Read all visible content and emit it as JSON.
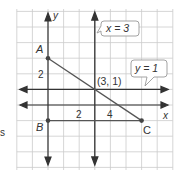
{
  "diagram": {
    "type": "coordinate-plane",
    "axes": {
      "x_label": "x",
      "y_label": "y",
      "x_tick_labels": [
        "2",
        "4"
      ],
      "y_tick_labels": [
        "2"
      ]
    },
    "points": [
      {
        "name": "A",
        "x": 0,
        "y": 3
      },
      {
        "name": "B",
        "x": 0,
        "y": -1
      },
      {
        "name": "C",
        "x": 6,
        "y": -1
      }
    ],
    "intersection": {
      "label": "(3, 1)",
      "x": 3,
      "y": 1
    },
    "lines": [
      {
        "equation": "x = 3",
        "orientation": "vertical"
      },
      {
        "equation": "y = 1",
        "orientation": "horizontal"
      }
    ],
    "segments": [
      "AC",
      "BC"
    ],
    "callouts": {
      "vertical_line": "x = 3",
      "horizontal_line": "y = 1"
    },
    "colors": {
      "grid": "#c8c8c8",
      "axis": "#333333",
      "line": "#333333",
      "segment": "#555555",
      "point": "#444444",
      "callout_border": "#999999",
      "text": "#333333"
    }
  },
  "edge_text": "s"
}
